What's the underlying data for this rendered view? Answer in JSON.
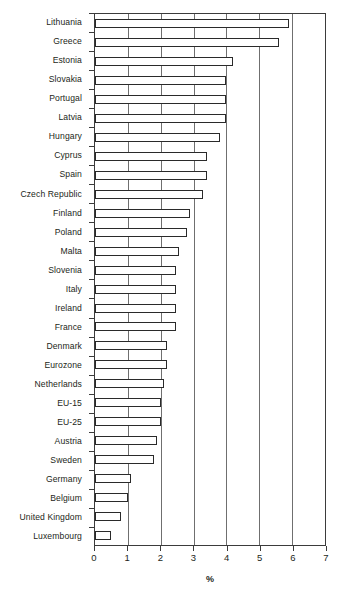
{
  "chart_data": {
    "type": "bar",
    "orientation": "horizontal",
    "title": "",
    "xlabel": "%",
    "ylabel": "",
    "xlim": [
      0,
      7
    ],
    "xticks": [
      0,
      1,
      2,
      3,
      4,
      5,
      6,
      7
    ],
    "xtick_labels": [
      "0",
      "1",
      "2",
      "3",
      "4",
      "5",
      "6",
      "7"
    ],
    "grid": true,
    "grid_axis": "x",
    "legend": false,
    "categories": [
      "Lithuania",
      "Greece",
      "Estonia",
      "Slovakia",
      "Portugal",
      "Latvia",
      "Hungary",
      "Cyprus",
      "Spain",
      "Czech Republic",
      "Finland",
      "Poland",
      "Malta",
      "Slovenia",
      "Italy",
      "Ireland",
      "France",
      "Denmark",
      "Eurozone",
      "Netherlands",
      "EU-15",
      "EU-25",
      "Austria",
      "Sweden",
      "Germany",
      "Belgium",
      "United Kingdom",
      "Luxembourg"
    ],
    "values": [
      5.9,
      5.6,
      4.2,
      4.0,
      4.0,
      4.0,
      3.8,
      3.4,
      3.4,
      3.3,
      2.9,
      2.8,
      2.55,
      2.45,
      2.45,
      2.45,
      2.45,
      2.2,
      2.2,
      2.1,
      2.0,
      2.0,
      1.9,
      1.8,
      1.1,
      1.0,
      0.8,
      0.5
    ],
    "bar_face_color": "#ffffff",
    "bar_edge_color": "#2a2a2a",
    "gridline_color": "#6f6f6f",
    "axis_color": "#3b3b3b"
  }
}
